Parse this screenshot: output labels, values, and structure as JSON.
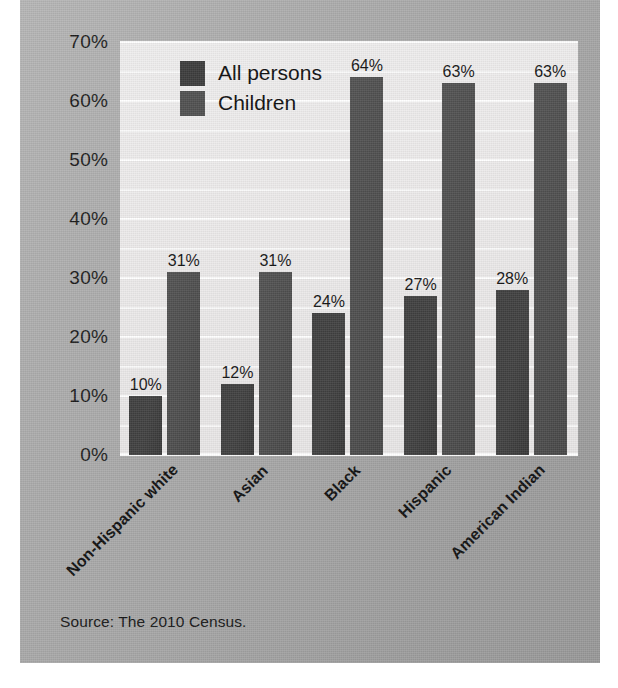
{
  "card": {
    "source_note": "Source: The 2010 Census."
  },
  "chart_data": {
    "type": "bar",
    "title": "",
    "subtitle": "",
    "xlabel": "",
    "ylabel": "",
    "ylim": [
      0,
      70
    ],
    "ytick_values": [
      0,
      10,
      20,
      30,
      40,
      50,
      60,
      70
    ],
    "ytick_labels": [
      "0%",
      "10%",
      "20%",
      "30%",
      "40%",
      "50%",
      "60%",
      "70%"
    ],
    "grid": true,
    "grid_minor_step": 5,
    "grid_color": "#ffffff",
    "legend_position": "top-left-inside",
    "categories": [
      "Non-Hispanic white",
      "Asian",
      "Black",
      "Hispanic",
      "American Indian"
    ],
    "series": [
      {
        "name": "All persons",
        "color": "#3c3c3c",
        "values": [
          10,
          12,
          24,
          27,
          28
        ],
        "labels": [
          "10%",
          "12%",
          "24%",
          "27%",
          "28%"
        ]
      },
      {
        "name": "Children",
        "color": "#505050",
        "values": [
          31,
          31,
          64,
          63,
          63
        ],
        "labels": [
          "31%",
          "31%",
          "64%",
          "63%",
          "63%"
        ]
      }
    ],
    "annotations": []
  }
}
